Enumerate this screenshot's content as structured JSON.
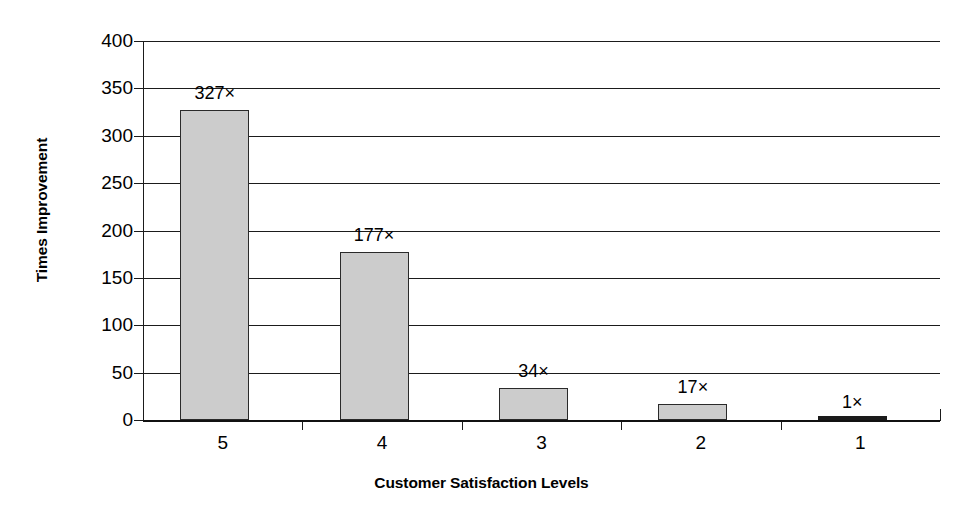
{
  "chart_data": {
    "type": "bar",
    "title": "",
    "subtitle": "",
    "xlabel": "Customer Satisfaction Levels",
    "ylabel": "Times Improvement",
    "categories": [
      "5",
      "4",
      "3",
      "2",
      "1"
    ],
    "values": [
      327,
      177,
      34,
      17,
      1
    ],
    "data_labels": [
      "327×",
      "177×",
      "34×",
      "17×",
      "1×"
    ],
    "series": [
      {
        "name": "Times Improvement",
        "values": [
          327,
          177,
          34,
          17,
          1
        ]
      }
    ],
    "ylim": [
      0,
      400
    ],
    "ytick_step": 50,
    "yticks": [
      400,
      350,
      300,
      250,
      200,
      150,
      100,
      50,
      0
    ],
    "ytick_labels": [
      "400",
      "350",
      "300",
      "250",
      "200",
      "150",
      "100",
      "50",
      "0"
    ],
    "xlim_categories": 5,
    "grid": true,
    "grid_axis": "y",
    "legend": false,
    "legend_position": "none",
    "bar_fill_color": "#cccccc",
    "bar_border_color": "#2a2a2a",
    "axis_color": "#1b1b1b",
    "background_color": "#ffffff",
    "text_color": "#000000"
  },
  "axes": {
    "y_title": "Times Improvement",
    "x_title": "Customer Satisfaction Levels"
  }
}
